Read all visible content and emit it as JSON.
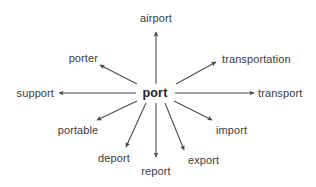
{
  "diagram": {
    "type": "word-web",
    "title_word": "port",
    "background_color": "#ffffff",
    "line_color": "#4a4a4a",
    "text_color": "#3b3b3b",
    "center": {
      "label": "port",
      "x": 155,
      "y": 93,
      "bold": true
    },
    "branches": [
      {
        "id": "airport",
        "label": "airport",
        "direction": "up",
        "label_x": 156,
        "label_y": 18,
        "anchor": "center",
        "line": {
          "x1": 156,
          "y1": 84,
          "x2": 156,
          "y2": 32
        }
      },
      {
        "id": "transportation",
        "label": "transportation",
        "direction": "up-right",
        "label_x": 222,
        "label_y": 59,
        "anchor": "left",
        "line": {
          "x1": 176,
          "y1": 84,
          "x2": 216,
          "y2": 62
        }
      },
      {
        "id": "transport",
        "label": "transport",
        "direction": "right",
        "label_x": 258,
        "label_y": 93,
        "anchor": "left",
        "line": {
          "x1": 175,
          "y1": 93,
          "x2": 254,
          "y2": 93
        }
      },
      {
        "id": "import",
        "label": "import",
        "direction": "down-right",
        "label_x": 216,
        "label_y": 130,
        "anchor": "left",
        "line": {
          "x1": 174,
          "y1": 101,
          "x2": 212,
          "y2": 120
        }
      },
      {
        "id": "export",
        "label": "export",
        "direction": "down-right-steep",
        "label_x": 188,
        "label_y": 160,
        "anchor": "left",
        "line": {
          "x1": 165,
          "y1": 103,
          "x2": 184,
          "y2": 150
        }
      },
      {
        "id": "report",
        "label": "report",
        "direction": "down",
        "label_x": 156,
        "label_y": 171,
        "anchor": "center",
        "line": {
          "x1": 156,
          "y1": 103,
          "x2": 156,
          "y2": 157
        }
      },
      {
        "id": "deport",
        "label": "deport",
        "direction": "down-left-steep",
        "label_x": 114,
        "label_y": 158,
        "anchor": "center",
        "line": {
          "x1": 146,
          "y1": 103,
          "x2": 126,
          "y2": 147
        }
      },
      {
        "id": "portable",
        "label": "portable",
        "direction": "down-left",
        "label_x": 78,
        "label_y": 130,
        "anchor": "center",
        "line": {
          "x1": 137,
          "y1": 101,
          "x2": 97,
          "y2": 120
        }
      },
      {
        "id": "support",
        "label": "support",
        "direction": "left",
        "label_x": 54,
        "label_y": 93,
        "anchor": "right",
        "line": {
          "x1": 136,
          "y1": 93,
          "x2": 59,
          "y2": 93
        }
      },
      {
        "id": "porter",
        "label": "porter",
        "direction": "up-left",
        "label_x": 98,
        "label_y": 58,
        "anchor": "right",
        "line": {
          "x1": 137,
          "y1": 84,
          "x2": 100,
          "y2": 65
        }
      }
    ]
  }
}
